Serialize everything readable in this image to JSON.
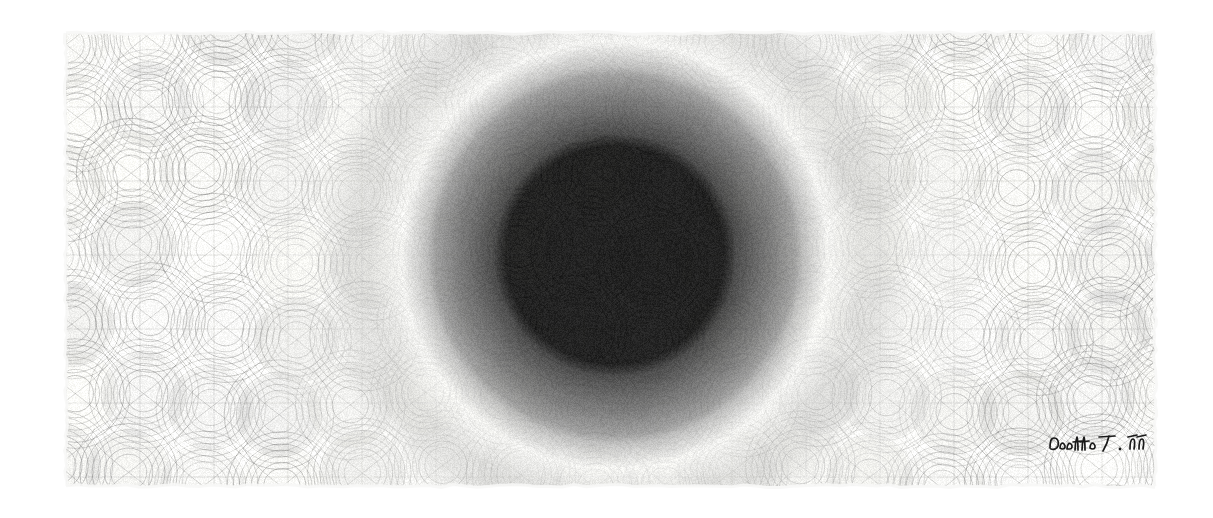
{
  "artwork": {
    "title": "Radial Moire Lattice",
    "medium_note": "geometric pen drawing on paper",
    "signature_text": "Dotto T. 19",
    "canvas": {
      "image_width": 1213,
      "image_height": 518,
      "background_color": "#ffffff",
      "panel_left": 66,
      "panel_top": 33,
      "panel_right": 1155,
      "panel_bottom": 486,
      "paper_base_color": "#ececea",
      "paper_edge_color": "#f7f7f6"
    },
    "focus": {
      "center_x": 615,
      "center_y": 255,
      "label": "black void core"
    },
    "rings": [
      {
        "name": "core",
        "radius": 112,
        "color": "#090909",
        "alpha": 1.0
      },
      {
        "name": "inner-dark",
        "radius": 152,
        "color": "#2c2c2c",
        "alpha": 0.95
      },
      {
        "name": "mid-dark",
        "radius": 188,
        "color": "#575757",
        "alpha": 0.88
      },
      {
        "name": "mid",
        "radius": 214,
        "color": "#7e7e7e",
        "alpha": 0.78
      },
      {
        "name": "bright-halo",
        "radius": 246,
        "color": "#e4e4e2",
        "alpha": 0.72
      },
      {
        "name": "outer-mid",
        "radius": 300,
        "color": "#b4b4b2",
        "alpha": 0.55
      },
      {
        "name": "outer-light",
        "radius": 380,
        "color": "#d2d2d0",
        "alpha": 0.4
      },
      {
        "name": "field",
        "radius": 640,
        "color": "#e3e3e1",
        "alpha": 0.22
      }
    ],
    "lattice": {
      "cell_size": 74,
      "arc_line_color": "#2a2a2a",
      "petal_fill_color": "#8d8d8b",
      "wave_amplitude": 26,
      "columns": 16,
      "rows": 7,
      "description": "grid of overlapping circular arcs forming lens and S-wave petals"
    },
    "grain": {
      "color": "#555555",
      "density": 0.035
    }
  }
}
